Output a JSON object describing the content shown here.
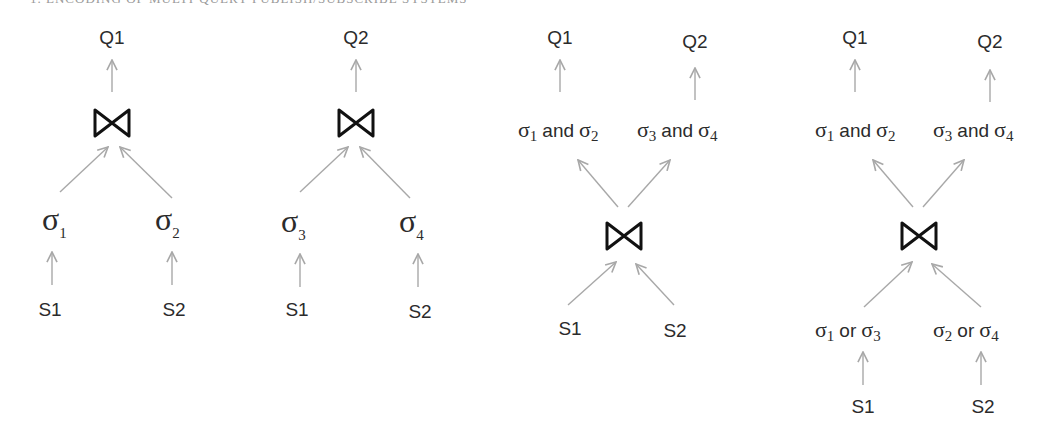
{
  "header": {
    "text": "1. ENCODING OF MULTI-QUERY PUBLISH/SUBSCRIBE SYSTEMS"
  },
  "icons": {
    "join": "bowtie-join-icon",
    "arrow": "arrow-up-icon"
  },
  "colors": {
    "arrow": "#a8a8a8",
    "text": "#2b2b2b",
    "join": "#111111"
  },
  "diagrams": [
    {
      "name": "plan-q1",
      "query": "Q1",
      "operator": "join",
      "inputs": [
        {
          "sel": "σ",
          "sub": "1",
          "source": "S1"
        },
        {
          "sel": "σ",
          "sub": "2",
          "source": "S2"
        }
      ]
    },
    {
      "name": "plan-q2",
      "query": "Q2",
      "operator": "join",
      "inputs": [
        {
          "sel": "σ",
          "sub": "3",
          "source": "S1"
        },
        {
          "sel": "σ",
          "sub": "4",
          "source": "S2"
        }
      ]
    },
    {
      "name": "shared-join-plan",
      "outputs": [
        {
          "query": "Q1",
          "a": "σ",
          "a_sub": "1",
          "op": "and",
          "b": "σ",
          "b_sub": "2"
        },
        {
          "query": "Q2",
          "a": "σ",
          "a_sub": "3",
          "op": "and",
          "b": "σ",
          "b_sub": "4"
        }
      ],
      "operator": "join",
      "sources": [
        "S1",
        "S2"
      ]
    },
    {
      "name": "shared-join-prefilter-plan",
      "outputs": [
        {
          "query": "Q1",
          "a": "σ",
          "a_sub": "1",
          "op": "and",
          "b": "σ",
          "b_sub": "2"
        },
        {
          "query": "Q2",
          "a": "σ",
          "a_sub": "3",
          "op": "and",
          "b": "σ",
          "b_sub": "4"
        }
      ],
      "operator": "join",
      "inputs": [
        {
          "a": "σ",
          "a_sub": "1",
          "op": "or",
          "b": "σ",
          "b_sub": "3",
          "source": "S1"
        },
        {
          "a": "σ",
          "a_sub": "2",
          "op": "or",
          "b": "σ",
          "b_sub": "4",
          "source": "S2"
        }
      ]
    }
  ]
}
